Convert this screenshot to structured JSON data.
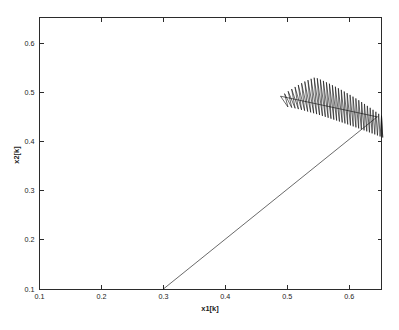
{
  "figure": {
    "background_color": "#ffffff",
    "axes_color": "#2b2b2b",
    "data_color": "#0d0d0d",
    "title": ""
  },
  "chart_data": {
    "type": "line",
    "title": "",
    "subtitle": "",
    "xlabel": "x1[k]",
    "ylabel": "x2[k]",
    "xlim": [
      0.1,
      0.652
    ],
    "ylim": [
      0.1,
      0.652
    ],
    "xticks": [
      0.1,
      0.2,
      0.3,
      0.4,
      0.5,
      0.6
    ],
    "xticklabels": [
      "0.1",
      "0.2",
      "0.3",
      "0.4",
      "0.5",
      "0.6"
    ],
    "yticks": [
      0.1,
      0.2,
      0.3,
      0.4,
      0.5,
      0.6
    ],
    "yticklabels": [
      "0.1",
      "0.2",
      "0.3",
      "0.4",
      "0.5",
      "0.6"
    ],
    "grid": false,
    "legend": null,
    "box": true,
    "tick_direction": "in",
    "annotations": [],
    "initial_point": [
      0.3,
      0.1
    ],
    "ramp_endpoint": [
      0.645,
      0.45
    ],
    "attractor_bounds": {
      "x1_min": 0.487,
      "x1_max": 0.652,
      "x2_min": 0.408,
      "x2_max": 0.548
    },
    "series": [
      {
        "name": "trajectory",
        "x": [
          0.3,
          0.645
        ],
        "y": [
          0.1,
          0.45
        ],
        "style": "solid-ramp"
      },
      {
        "name": "oscillatory-attractor",
        "style": "zigzag",
        "zigzag_count": 34,
        "left_tip": [
          0.489,
          0.492
        ],
        "top_peak": [
          0.553,
          0.548
        ],
        "right_end": [
          0.652,
          0.452
        ],
        "lower_envelope_left": [
          0.497,
          0.47
        ],
        "lower_envelope_right": [
          0.65,
          0.408
        ]
      }
    ]
  }
}
